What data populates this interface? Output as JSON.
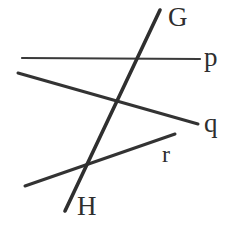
{
  "figure": {
    "background_color": "#ffffff",
    "stroke_color": "#333333",
    "label_color": "#2e2e2e",
    "width": 236,
    "height": 236
  },
  "labels": {
    "point_g": "G",
    "point_h": "H",
    "line_p": "p",
    "line_q": "q",
    "line_r": "r"
  },
  "chart_data": {
    "type": "diagram",
    "xlim": [
      0,
      236
    ],
    "ylim": [
      0,
      236
    ],
    "grid": false,
    "legend": "none",
    "segments": [
      {
        "name": "line-p",
        "label": "p",
        "x1": 22,
        "y1": 58,
        "x2": 200,
        "y2": 59,
        "stroke_width": 2.2,
        "color": "#3a3a3a"
      },
      {
        "name": "line-q",
        "label": "q",
        "x1": 18,
        "y1": 73,
        "x2": 198,
        "y2": 124,
        "stroke_width": 3.0,
        "color": "#333333"
      },
      {
        "name": "line-r",
        "label": "r",
        "x1": 25,
        "y1": 186,
        "x2": 175,
        "y2": 134,
        "stroke_width": 3.0,
        "color": "#333333"
      },
      {
        "name": "line-gh",
        "label": "GH",
        "x1": 160,
        "y1": 10,
        "x2": 65,
        "y2": 211,
        "stroke_width": 3.6,
        "color": "#2f2f2f"
      }
    ],
    "labeled_points": [
      {
        "name": "G",
        "x": 160,
        "y": 10,
        "label_x": 168,
        "label_y": 4
      },
      {
        "name": "H",
        "x": 65,
        "y": 211,
        "label_x": 77,
        "label_y": 193
      }
    ],
    "intersections": [
      {
        "name": "gh-crosses-p",
        "lines": [
          "line-gh",
          "line-p"
        ],
        "x": 143,
        "y": 59
      },
      {
        "name": "gh-crosses-q",
        "lines": [
          "line-gh",
          "line-q"
        ],
        "x": 120,
        "y": 104
      },
      {
        "name": "gh-crosses-r",
        "lines": [
          "line-gh",
          "line-r"
        ],
        "x": 88,
        "y": 163
      }
    ]
  }
}
